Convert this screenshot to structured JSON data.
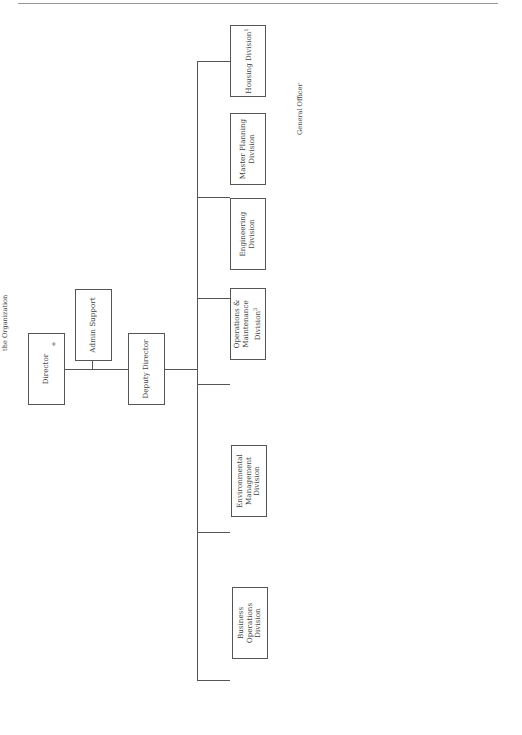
{
  "director": {
    "label": "Director",
    "marker": "+",
    "duties": [
      "- Management of",
      "the Organization"
    ]
  },
  "admin_support_top": {
    "label": "Admin Support"
  },
  "deputy_director": {
    "label": "Deputy Director"
  },
  "divisions": {
    "business_operations": {
      "label": "Business Operations Division",
      "branches": [
        "Admin Support",
        "Contract Support Branch"
      ],
      "duties": [
        "Contract Administration",
        "Budget & Accounting",
        "Personnel Management",
        "Training",
        "Work Reception and Management",
        "Automation Technology",
        "Track Backlog Maintenance & Repair",
        "Develop Annual Work Plan",
        "Conduct Review & Analysis",
        "Oversee Materials Control",
        "Coordinate Public Affairs",
        "Develop DPW Business Plan"
      ]
    },
    "environmental": {
      "label": "Environmental Management Division",
      "branches": [
        "Environmental Support Branch",
        "Conservation Branch",
        "Land Management Branch"
      ],
      "duties": [
        "Environmental Management",
        "Pollution Control",
        "Natural Resource Management",
        "Solid Waste & Recycling",
        "Pest Control",
        "Hazardous Waste Management",
        "Environmental & Regulatory",
        "Coordination and Compliance"
      ]
    },
    "operations": {
      "label": "Operations & Maintenance Division",
      "sup": "3",
      "duties": [
        "Energy Programs",
        "Maintenance & Repair",
        "Lock & Key Support",
        "Electronic Access Maintenance",
        "Fire Protection Systems",
        "HVAC & Controls",
        "Boilers & HW Heaters",
        "Custodial Cleaning",
        "Special Event Support",
        "Preventive Maintenance",
        "Equipment & Vehicle",
        "Maintenance",
        "Utilities Operation & Acquisition",
        "Roads & Grounds",
        "Service Contracts"
      ]
    },
    "engineering": {
      "label": "Engineering Division",
      "branches": [
        "Project Development Branch",
        "Project Design Branch",
        "Construction Inspection Branch"
      ],
      "duties": [
        "Maintain & Coordinate Design",
        "Guides",
        "Project Design",
        "Project Management",
        "Project Inspection & Quality",
        "Assurance",
        "Construction Management",
        "Demolition of Real Property"
      ]
    },
    "master_planning": {
      "label": "Master Planning Division",
      "duties": [
        "Real Property",
        "Master Planning",
        "Real Estate",
        "Management",
        "Space management",
        "Real Property Asset",
        "Management",
        "Document Archives",
        "Sustainability"
      ]
    },
    "housing": {
      "label": "Housing Division",
      "sup": "1",
      "duties": [
        "General Officer",
        "Quarters",
        "Unaccompanied",
        "Housing",
        "Family Housing",
        "Transient Housing",
        "Furnishings",
        "Management"
      ]
    }
  },
  "notes": {
    "heading": "Notes:",
    "items": [
      "1. Director reports to county/",
      "city managers.",
      "2. Major construction may be",
      "designed/built by outside agency.",
      "3. Typically contracted."
    ],
    "key_heading": "Key:",
    "key_items": [
      {
        "symbol": "+",
        "label": "Facility Manager"
      }
    ]
  }
}
